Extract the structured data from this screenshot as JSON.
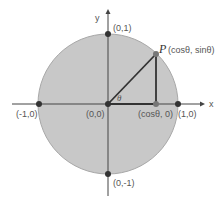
{
  "diagram": {
    "axes": {
      "x_label": "x",
      "y_label": "y"
    },
    "points": {
      "top": "(0,1)",
      "bottom": "(0,-1)",
      "left": "(-1,0)",
      "right": "(1,0)",
      "origin": "(0,0)",
      "foot": "(cosθ, 0)",
      "p_name": "P",
      "p_coords": "(cosθ, sinθ)"
    },
    "angle_label": "θ",
    "colors": {
      "circle_fill": "#c8c8c8",
      "circle_stroke": "#a8a8a8",
      "axis": "#444444",
      "dot": "#333333",
      "p_dot": "#777777"
    }
  }
}
